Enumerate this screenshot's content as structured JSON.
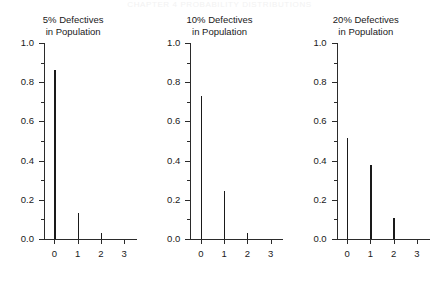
{
  "page_header": "CHAPTER 4  PROBABILITY DISTRIBUTIONS",
  "figure": {
    "name": "binomial-probability-panels",
    "colors": {
      "axis": "#2b2b2b",
      "spike": "#1a1a1a",
      "text": "#1a1a1a",
      "background": "#ffffff"
    }
  },
  "chart_data": [
    {
      "type": "bar",
      "title": "5% Defectives\nin Population",
      "title_line1": "5% Defectives",
      "title_line2": "in Population",
      "xlabel": "",
      "ylabel": "",
      "categories": [
        "0",
        "1",
        "2",
        "3"
      ],
      "x": [
        0,
        1,
        2,
        3
      ],
      "values": [
        0.86,
        0.135,
        0.03,
        0.0
      ],
      "ylim": [
        0.0,
        1.0
      ],
      "xlim": [
        -0.45,
        3.55
      ],
      "ytick_labels": [
        "0.0",
        "0.2",
        "0.4",
        "0.6",
        "0.8",
        "1.0"
      ],
      "ytick_values": [
        0.0,
        0.2,
        0.4,
        0.6,
        0.8,
        1.0
      ],
      "yminor_values": [
        0.1,
        0.3,
        0.5,
        0.7,
        0.9
      ],
      "grid": false,
      "legend": "none"
    },
    {
      "type": "bar",
      "title": "10% Defectives\nin Population",
      "title_line1": "10% Defectives",
      "title_line2": "in Population",
      "xlabel": "",
      "ylabel": "",
      "categories": [
        "0",
        "1",
        "2",
        "3"
      ],
      "x": [
        0,
        1,
        2,
        3
      ],
      "values": [
        0.73,
        0.245,
        0.03,
        0.0
      ],
      "ylim": [
        0.0,
        1.0
      ],
      "xlim": [
        -0.45,
        3.55
      ],
      "ytick_labels": [
        "0.0",
        "0.2",
        "0.4",
        "0.6",
        "0.8",
        "1.0"
      ],
      "ytick_values": [
        0.0,
        0.2,
        0.4,
        0.6,
        0.8,
        1.0
      ],
      "yminor_values": [
        0.1,
        0.3,
        0.5,
        0.7,
        0.9
      ],
      "grid": false,
      "legend": "none"
    },
    {
      "type": "bar",
      "title": "20% Defectives\nin Population",
      "title_line1": "20% Defectives",
      "title_line2": "in Population",
      "xlabel": "",
      "ylabel": "",
      "categories": [
        "0",
        "1",
        "2",
        "3"
      ],
      "x": [
        0,
        1,
        2,
        3
      ],
      "values": [
        0.515,
        0.38,
        0.105,
        0.0
      ],
      "ylim": [
        0.0,
        1.0
      ],
      "xlim": [
        -0.45,
        3.55
      ],
      "ytick_labels": [
        "0.0",
        "0.2",
        "0.4",
        "0.6",
        "0.8",
        "1.0"
      ],
      "ytick_values": [
        0.0,
        0.2,
        0.4,
        0.6,
        0.8,
        1.0
      ],
      "yminor_values": [
        0.1,
        0.3,
        0.5,
        0.7,
        0.9
      ],
      "grid": false,
      "legend": "none"
    }
  ]
}
